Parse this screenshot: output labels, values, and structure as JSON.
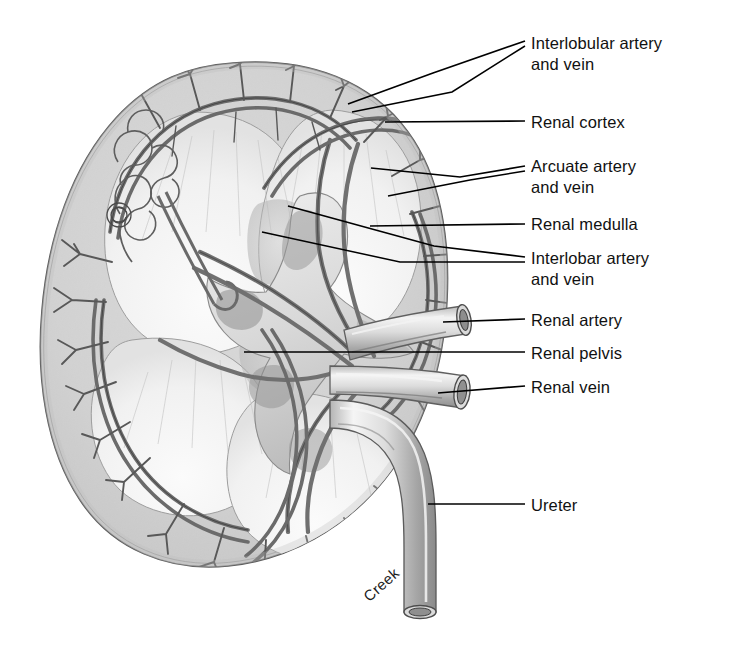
{
  "figure": {
    "signature": "Creek",
    "background_color": "#ffffff",
    "ink_color": "#111111",
    "cortex_tone": "#dcdcdc",
    "medulla_tone": "#f2f2f2",
    "vessel_tone": "#9a9a9a",
    "pelvis_tone": "#cfcfcf"
  },
  "labels": [
    {
      "id": "interlobular-artery-and-vein",
      "text": "Interlobular artery\nand vein",
      "x": 531,
      "y": 33
    },
    {
      "id": "renal-cortex",
      "text": "Renal cortex",
      "x": 531,
      "y": 112
    },
    {
      "id": "arcuate-artery-and-vein",
      "text": "Arcuate artery\nand vein",
      "x": 531,
      "y": 156
    },
    {
      "id": "renal-medulla",
      "text": "Renal medulla",
      "x": 531,
      "y": 214
    },
    {
      "id": "interlobar-artery-and-vein",
      "text": "Interlobar artery\nand vein",
      "x": 531,
      "y": 248
    },
    {
      "id": "renal-artery",
      "text": "Renal artery",
      "x": 531,
      "y": 310
    },
    {
      "id": "renal-pelvis",
      "text": "Renal pelvis",
      "x": 531,
      "y": 343
    },
    {
      "id": "renal-vein",
      "text": "Renal vein",
      "x": 531,
      "y": 377
    },
    {
      "id": "ureter",
      "text": "Ureter",
      "x": 531,
      "y": 495
    }
  ],
  "structures": [
    {
      "id": "renal-capsule",
      "name": "Renal capsule outline"
    },
    {
      "id": "renal-cortex-region",
      "name": "Renal cortex"
    },
    {
      "id": "renal-medulla-pyramids",
      "name": "Renal medulla pyramids"
    },
    {
      "id": "renal-columns",
      "name": "Renal columns"
    },
    {
      "id": "renal-pelvis-region",
      "name": "Renal pelvis"
    },
    {
      "id": "major-calyces",
      "name": "Major calyces"
    },
    {
      "id": "renal-artery-vessel",
      "name": "Renal artery"
    },
    {
      "id": "renal-vein-vessel",
      "name": "Renal vein"
    },
    {
      "id": "ureter-tube",
      "name": "Ureter"
    },
    {
      "id": "interlobar-vessels",
      "name": "Interlobar artery and vein"
    },
    {
      "id": "arcuate-vessels",
      "name": "Arcuate artery and vein"
    },
    {
      "id": "interlobular-vessels",
      "name": "Interlobular artery and vein"
    },
    {
      "id": "nephron-glomerulus-detail",
      "name": "Nephron and glomerulus detail"
    }
  ]
}
